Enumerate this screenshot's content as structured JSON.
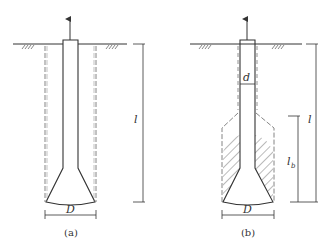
{
  "figure": {
    "panels": [
      {
        "id": "a",
        "caption": "(a)",
        "labels": {
          "length": "l",
          "diameter": "D"
        },
        "description": "Belled pile under uplift: cylindrical failure surface along full length l"
      },
      {
        "id": "b",
        "caption": "(b)",
        "labels": {
          "length": "l",
          "shaft_diameter": "d",
          "bell_length_main": "l",
          "bell_length_sub": "b",
          "diameter": "D"
        },
        "description": "Belled pile under uplift: shaft friction along d, enlarged failure zone over length l_b near bell (hatched soil)"
      }
    ],
    "colors": {
      "line": "#333333",
      "dashed": "#777777",
      "hatch": "#555555"
    }
  }
}
